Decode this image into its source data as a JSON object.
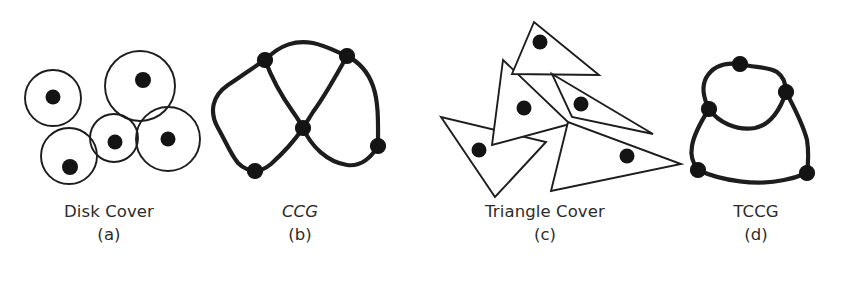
{
  "figure": {
    "background_color": "#ffffff",
    "ink_color": "#1d1d1d",
    "dot_color": "#141414",
    "width": 847,
    "height": 282
  },
  "panels": [
    {
      "id": "a",
      "title": "Disk Cover",
      "index": "(a)",
      "title_style": "normal",
      "kind": "disk-cover"
    },
    {
      "id": "b",
      "title": "CCG",
      "index": "(b)",
      "title_style": "italic",
      "kind": "curved-graph"
    },
    {
      "id": "c",
      "title": "Triangle Cover",
      "index": "(c)",
      "title_style": "normal",
      "kind": "triangle-cover"
    },
    {
      "id": "d",
      "title": "TCCG",
      "index": "(d)",
      "title_style": "normal",
      "kind": "curved-graph"
    }
  ],
  "panel_a_disks": [
    {
      "cx": 53,
      "cy": 98,
      "r": 28,
      "dot_x": 53,
      "dot_y": 97,
      "dot_r": 7.5
    },
    {
      "cx": 140,
      "cy": 86,
      "r": 35,
      "dot_x": 143,
      "dot_y": 80,
      "dot_r": 8.0
    },
    {
      "cx": 69,
      "cy": 156,
      "r": 28,
      "dot_x": 70,
      "dot_y": 167,
      "dot_r": 8.0
    },
    {
      "cx": 114,
      "cy": 138,
      "r": 24,
      "dot_x": 115,
      "dot_y": 142,
      "dot_r": 7.5
    },
    {
      "cx": 168,
      "cy": 139,
      "r": 32,
      "dot_x": 168,
      "dot_y": 139,
      "dot_r": 7.5
    }
  ],
  "panel_b_graph": {
    "nodes": [
      {
        "name": "n-top-left",
        "x": 265,
        "y": 60,
        "r": 7.5
      },
      {
        "name": "n-top-right",
        "x": 347,
        "y": 56,
        "r": 7.5
      },
      {
        "name": "n-center",
        "x": 303,
        "y": 128,
        "r": 7.5
      },
      {
        "name": "n-bottom-left",
        "x": 255,
        "y": 171,
        "r": 7.5
      },
      {
        "name": "n-bottom-right",
        "x": 378,
        "y": 146,
        "r": 7.5
      }
    ],
    "edge_count": 6
  },
  "panel_c_triangles": [
    {
      "name": "triangle-top",
      "points": "534,22 513,73 598,74",
      "dot_x": 540,
      "dot_y": 42,
      "dot_r": 7.5
    },
    {
      "name": "triangle-middle-left",
      "points": "503,60 492,144 569,123",
      "dot_x": 524,
      "dot_y": 108,
      "dot_r": 7.5
    },
    {
      "name": "triangle-middle-right",
      "points": "553,75 651,133 573,116",
      "dot_x": 580,
      "dot_y": 104,
      "dot_r": 7.5
    },
    {
      "name": "triangle-lower-left",
      "points": "441,117 495,195 545,142",
      "dot_x": 479,
      "dot_y": 150,
      "dot_r": 7.5
    },
    {
      "name": "triangle-lower-right",
      "points": "567,123 551,190 679,163",
      "dot_x": 627,
      "dot_y": 156,
      "dot_r": 7.5
    }
  ],
  "panel_d_graph": {
    "nodes": [
      {
        "name": "n-top",
        "x": 740,
        "y": 64,
        "r": 7.5
      },
      {
        "name": "n-right",
        "x": 786,
        "y": 92,
        "r": 7.5
      },
      {
        "name": "n-left",
        "x": 709,
        "y": 109,
        "r": 7.5
      },
      {
        "name": "n-bottom-left",
        "x": 698,
        "y": 170,
        "r": 7.5
      },
      {
        "name": "n-bottom-right",
        "x": 807,
        "y": 173,
        "r": 7.5
      }
    ],
    "edge_count": 6
  }
}
